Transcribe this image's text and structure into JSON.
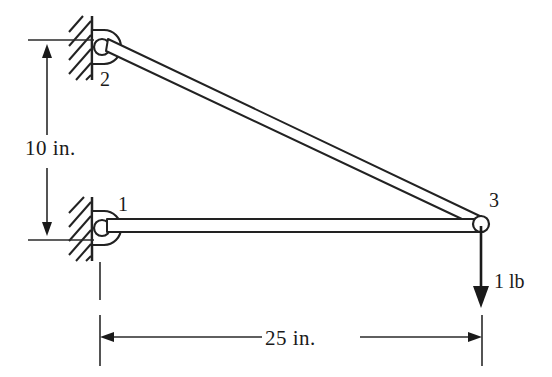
{
  "figure": {
    "background_color": "#ffffff",
    "line_color": "#222222"
  },
  "joints": [
    {
      "id": "1",
      "label": "1",
      "type": "pinned-support",
      "x": 102,
      "y": 228,
      "label_x": 118,
      "label_y": 211
    },
    {
      "id": "2",
      "label": "2",
      "type": "pinned-support",
      "x": 102,
      "y": 47,
      "label_x": 100,
      "label_y": 86
    },
    {
      "id": "3",
      "label": "3",
      "type": "free-joint",
      "x": 481,
      "y": 224,
      "label_x": 489,
      "label_y": 207
    }
  ],
  "members": [
    {
      "name": "member-2-3",
      "from": "2",
      "to": "3"
    },
    {
      "name": "member-1-3",
      "from": "1",
      "to": "3"
    }
  ],
  "dimensions": [
    {
      "name": "vertical-dimension",
      "label": "10 in.",
      "orientation": "vertical",
      "value": 10,
      "unit": "in.",
      "label_x": 25,
      "label_y": 155
    },
    {
      "name": "horizontal-dimension",
      "label": "25 in.",
      "orientation": "horizontal",
      "value": 25,
      "unit": "in.",
      "label_x": 265,
      "label_y": 345
    }
  ],
  "load": {
    "name": "applied-load",
    "label": "1 lb",
    "magnitude": 1,
    "unit": "lb",
    "direction": "down",
    "at_joint": "3",
    "label_x": 494,
    "label_y": 288
  }
}
